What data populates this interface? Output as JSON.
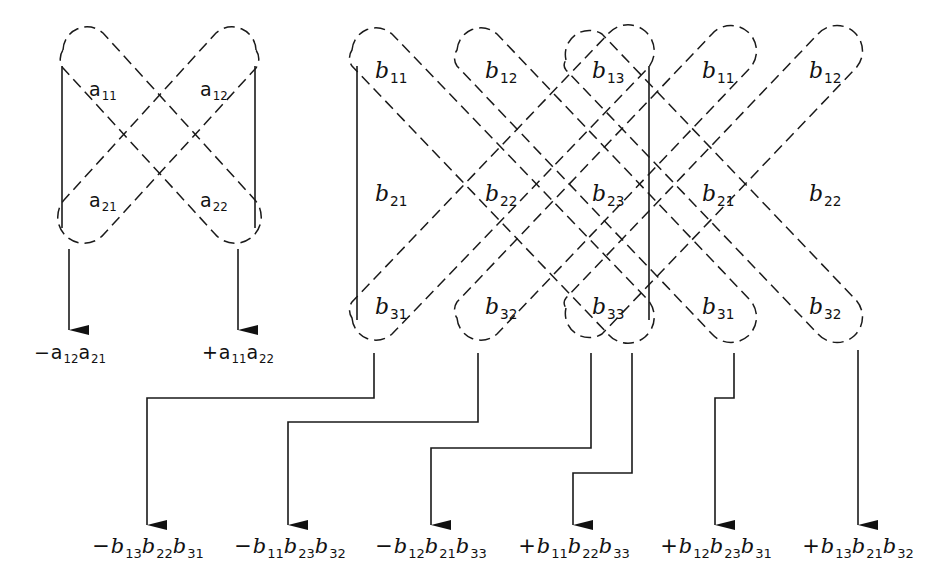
{
  "figure": {
    "title": ""
  },
  "matrix_2x2": {
    "entries": [
      {
        "id": "a11",
        "base": "a",
        "sub": "11"
      },
      {
        "id": "a12",
        "base": "a",
        "sub": "12"
      },
      {
        "id": "a21",
        "base": "a",
        "sub": "21"
      },
      {
        "id": "a22",
        "base": "a",
        "sub": "22"
      }
    ],
    "terms": [
      {
        "sign": "−",
        "factors": [
          {
            "base": "a",
            "sub": "12"
          },
          {
            "base": "a",
            "sub": "21"
          }
        ]
      },
      {
        "sign": "+",
        "factors": [
          {
            "base": "a",
            "sub": "11"
          },
          {
            "base": "a",
            "sub": "22"
          }
        ]
      }
    ]
  },
  "matrix_3x3": {
    "grid": [
      [
        {
          "base": "b",
          "sub": "11"
        },
        {
          "base": "b",
          "sub": "12"
        },
        {
          "base": "b",
          "sub": "13"
        },
        {
          "base": "b",
          "sub": "11"
        },
        {
          "base": "b",
          "sub": "12"
        }
      ],
      [
        {
          "base": "b",
          "sub": "21"
        },
        {
          "base": "b",
          "sub": "22"
        },
        {
          "base": "b",
          "sub": "23"
        },
        {
          "base": "b",
          "sub": "21"
        },
        {
          "base": "b",
          "sub": "22"
        }
      ],
      [
        {
          "base": "b",
          "sub": "31"
        },
        {
          "base": "b",
          "sub": "32"
        },
        {
          "base": "b",
          "sub": "33"
        },
        {
          "base": "b",
          "sub": "31"
        },
        {
          "base": "b",
          "sub": "32"
        }
      ]
    ],
    "terms": [
      {
        "sign": "−",
        "factors": [
          {
            "base": "b",
            "sub": "13"
          },
          {
            "base": "b",
            "sub": "22"
          },
          {
            "base": "b",
            "sub": "31"
          }
        ]
      },
      {
        "sign": "−",
        "factors": [
          {
            "base": "b",
            "sub": "11"
          },
          {
            "base": "b",
            "sub": "23"
          },
          {
            "base": "b",
            "sub": "32"
          }
        ]
      },
      {
        "sign": "−",
        "factors": [
          {
            "base": "b",
            "sub": "12"
          },
          {
            "base": "b",
            "sub": "21"
          },
          {
            "base": "b",
            "sub": "33"
          }
        ]
      },
      {
        "sign": "+",
        "factors": [
          {
            "base": "b",
            "sub": "11"
          },
          {
            "base": "b",
            "sub": "22"
          },
          {
            "base": "b",
            "sub": "33"
          }
        ]
      },
      {
        "sign": "+",
        "factors": [
          {
            "base": "b",
            "sub": "12"
          },
          {
            "base": "b",
            "sub": "23"
          },
          {
            "base": "b",
            "sub": "31"
          }
        ]
      },
      {
        "sign": "+",
        "factors": [
          {
            "base": "b",
            "sub": "13"
          },
          {
            "base": "b",
            "sub": "21"
          },
          {
            "base": "b",
            "sub": "32"
          }
        ]
      }
    ]
  },
  "colors": {
    "line": "#1a1a1a",
    "background": "#ffffff"
  }
}
